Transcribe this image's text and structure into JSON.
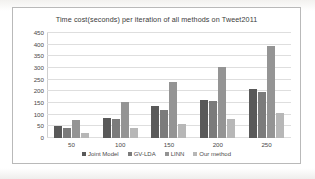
{
  "chart_data": {
    "type": "bar",
    "title": "Time cost(seconds) per iteration of all methods on Tweet2011",
    "xlabel": "",
    "ylabel": "",
    "ylim": [
      0,
      450
    ],
    "ytick_step": 50,
    "yticks": [
      450,
      400,
      350,
      300,
      250,
      200,
      150,
      100,
      50,
      0
    ],
    "grid": true,
    "legend_position": "bottom",
    "categories": [
      "50",
      "100",
      "150",
      "200",
      "250"
    ],
    "series": [
      {
        "name": "Joint Model",
        "color": "#595959",
        "values": [
          51,
          87,
          136,
          165,
          212
        ]
      },
      {
        "name": "GV-LDA",
        "color": "#7b7b7b",
        "values": [
          42,
          80,
          121,
          158,
          196
        ]
      },
      {
        "name": "LINN",
        "color": "#949494",
        "values": [
          79,
          153,
          238,
          304,
          395
        ]
      },
      {
        "name": "Our method",
        "color": "#b7b7b7",
        "values": [
          21,
          44,
          62,
          81,
          107
        ]
      }
    ]
  }
}
